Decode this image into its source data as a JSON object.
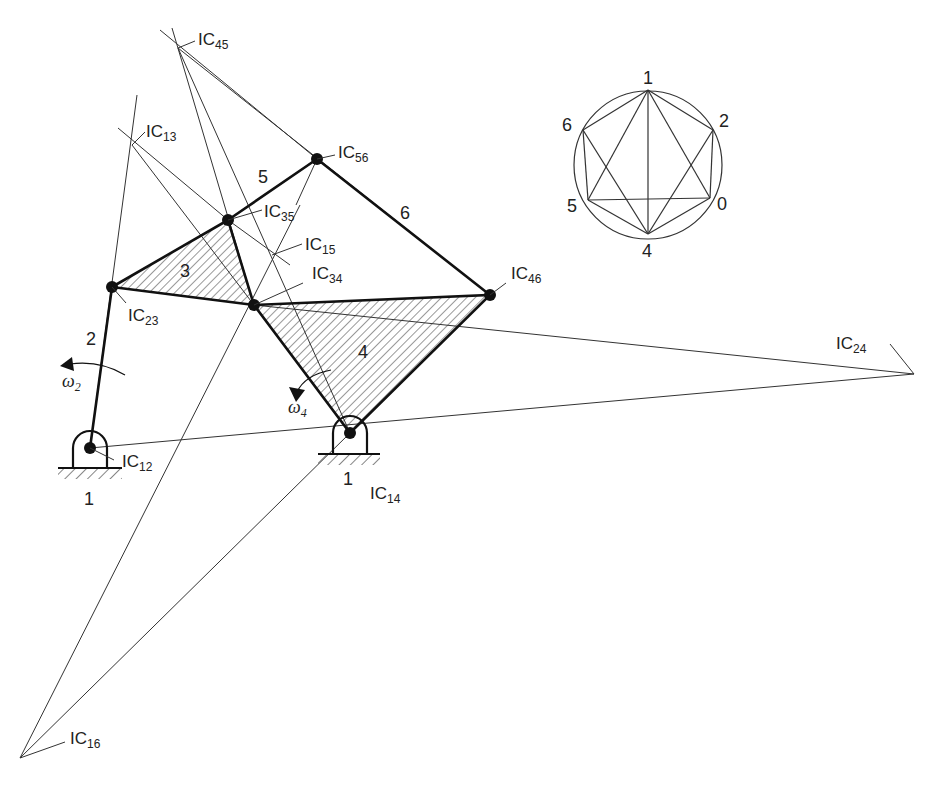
{
  "figure": {
    "type": "kinematic-linkage-instant-centers"
  },
  "instant_centers": [
    {
      "id": "IC12",
      "prefix": "IC",
      "sub": "12"
    },
    {
      "id": "IC13",
      "prefix": "IC",
      "sub": "13"
    },
    {
      "id": "IC14",
      "prefix": "IC",
      "sub": "14"
    },
    {
      "id": "IC15",
      "prefix": "IC",
      "sub": "15"
    },
    {
      "id": "IC16",
      "prefix": "IC",
      "sub": "16"
    },
    {
      "id": "IC23",
      "prefix": "IC",
      "sub": "23"
    },
    {
      "id": "IC24",
      "prefix": "IC",
      "sub": "24"
    },
    {
      "id": "IC34",
      "prefix": "IC",
      "sub": "34"
    },
    {
      "id": "IC35",
      "prefix": "IC",
      "sub": "35"
    },
    {
      "id": "IC45",
      "prefix": "IC",
      "sub": "45"
    },
    {
      "id": "IC46",
      "prefix": "IC",
      "sub": "46"
    },
    {
      "id": "IC56",
      "prefix": "IC",
      "sub": "56"
    }
  ],
  "links": {
    "ground_left": "1",
    "ground_right": "1",
    "link2": "2",
    "link3": "3",
    "link4": "4",
    "link5": "5",
    "link6": "6"
  },
  "angular_velocities": {
    "omega2": {
      "symbol": "ω",
      "sub": "2"
    },
    "omega4": {
      "symbol": "ω",
      "sub": "4"
    }
  },
  "circle_diagram": {
    "nodes": [
      "1",
      "2",
      "0",
      "4",
      "5",
      "6"
    ]
  }
}
